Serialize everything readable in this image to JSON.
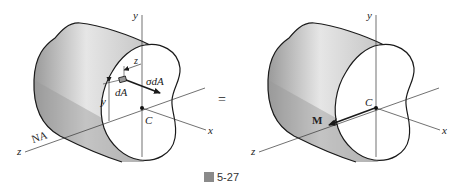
{
  "figure": {
    "caption_prefix": "圖",
    "caption_number": "5-27",
    "equals_sign": "="
  },
  "left_diagram": {
    "labels": {
      "y_axis": "y",
      "x_axis": "x",
      "z_axis": "z",
      "neutral_axis": "NA",
      "centroid": "C",
      "element_area": "dA",
      "force": "σdA",
      "y_distance": "y",
      "z_distance": "z"
    }
  },
  "right_diagram": {
    "labels": {
      "y_axis": "y",
      "x_axis": "x",
      "z_axis": "z",
      "centroid": "C",
      "moment": "M"
    }
  },
  "colors": {
    "line": "#1a1a1a",
    "axis": "#333333",
    "shade_dark": "#8c8c8c",
    "shade_light": "#f2f2f2"
  }
}
